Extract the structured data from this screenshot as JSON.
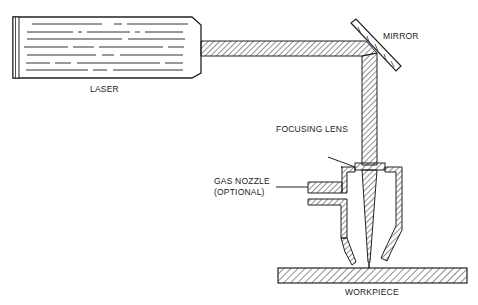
{
  "diagram": {
    "type": "laser cutting setup schematic",
    "labels": {
      "laser": "LASER",
      "mirror": "MIRROR",
      "focusing_lens": "FOCUSING LENS",
      "gas_nozzle_line1": "GAS NOZZLE",
      "gas_nozzle_line2": "(OPTIONAL)",
      "workpiece": "WORKPIECE"
    },
    "colors": {
      "stroke": "#222222",
      "background": "#ffffff"
    }
  }
}
